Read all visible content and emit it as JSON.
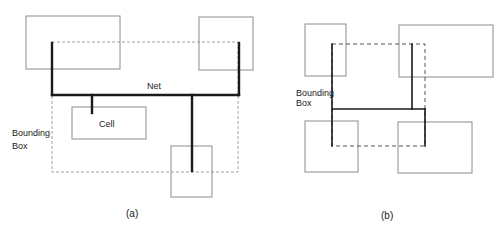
{
  "colors": {
    "cell_stroke": "#8c8c8c",
    "net_stroke": "#1a1a1a",
    "bbox_stroke": "#8a8a8a",
    "text": "#222222",
    "background": "#ffffff"
  },
  "panel_a": {
    "caption": "(a)",
    "net_label": "Net",
    "cell_label": "Cell",
    "bbox_label_line1": "Bounding",
    "bbox_label_line2": "Box",
    "cells": [
      {
        "name": "top-left-cell",
        "x": 26,
        "y": 16,
        "w": 94,
        "h": 53
      },
      {
        "name": "top-right-cell",
        "x": 199,
        "y": 17,
        "w": 54,
        "h": 53
      },
      {
        "name": "center-cell",
        "x": 72,
        "y": 107,
        "w": 74,
        "h": 32
      },
      {
        "name": "bottom-cell",
        "x": 171,
        "y": 146,
        "w": 41,
        "h": 51
      }
    ],
    "bounding_box": {
      "x": 52,
      "y": 42,
      "w": 186,
      "h": 130
    },
    "net_segments": [
      {
        "x1": 52,
        "y1": 42,
        "x2": 52,
        "y2": 95
      },
      {
        "x1": 52,
        "y1": 95,
        "x2": 239,
        "y2": 95
      },
      {
        "x1": 239,
        "y1": 43,
        "x2": 239,
        "y2": 95
      },
      {
        "x1": 92,
        "y1": 95,
        "x2": 92,
        "y2": 113
      },
      {
        "x1": 192,
        "y1": 95,
        "x2": 192,
        "y2": 172
      }
    ]
  },
  "panel_b": {
    "caption": "(b)",
    "bbox_label_line1": "Bounding",
    "bbox_label_line2": "Box",
    "cells": [
      {
        "name": "top-left-cell",
        "x": 305,
        "y": 24,
        "w": 41,
        "h": 52
      },
      {
        "name": "top-right-cell",
        "x": 399,
        "y": 25,
        "w": 94,
        "h": 52
      },
      {
        "name": "bottom-left-cell",
        "x": 305,
        "y": 121,
        "w": 53,
        "h": 51
      },
      {
        "name": "bottom-right-cell",
        "x": 398,
        "y": 122,
        "w": 74,
        "h": 51
      }
    ],
    "bounding_box": {
      "x": 332,
      "y": 44,
      "w": 93,
      "h": 102
    },
    "net_segments": [
      {
        "x1": 332,
        "y1": 44,
        "x2": 332,
        "y2": 146
      },
      {
        "x1": 332,
        "y1": 109,
        "x2": 425,
        "y2": 109
      },
      {
        "x1": 412,
        "y1": 44,
        "x2": 412,
        "y2": 109
      },
      {
        "x1": 425,
        "y1": 109,
        "x2": 425,
        "y2": 146
      }
    ]
  }
}
